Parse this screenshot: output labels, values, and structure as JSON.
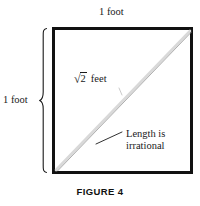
{
  "figure": {
    "caption": "FIGURE 4",
    "top_label": "1 foot",
    "left_label": "1 foot",
    "diagonal_label": {
      "radical_sign": "√",
      "radicand": "2",
      "unit": "feet",
      "full_text": "√2 feet"
    },
    "annotation": {
      "line1": "Length is",
      "line2": "irrational",
      "full_text": "Length is irrational"
    },
    "shape": {
      "type": "square",
      "side_length": "1 foot",
      "diagonal_length": "√2 feet"
    },
    "colors": {
      "square_border": "#111111",
      "diagonal_dark": "#8a8a8a",
      "diagonal_light": "#d8d8d8",
      "text": "#1a1a1a",
      "background": "#ffffff"
    }
  }
}
